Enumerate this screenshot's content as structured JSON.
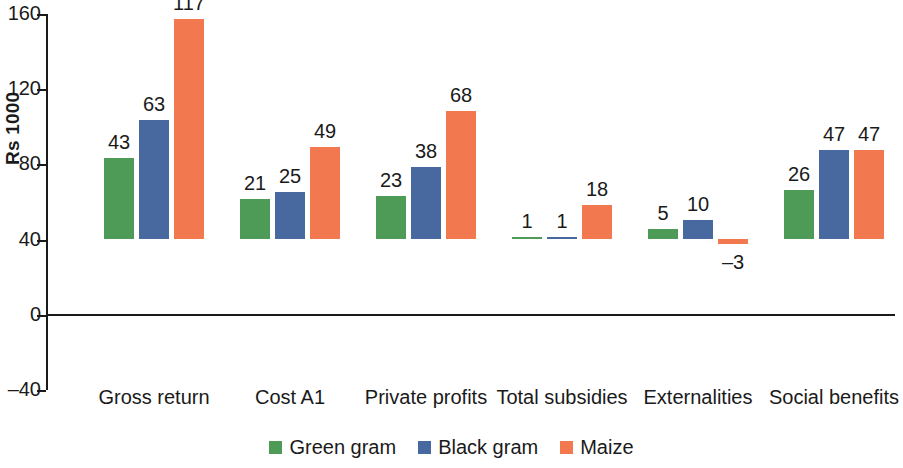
{
  "chart_data": {
    "type": "bar",
    "title": "",
    "subtitle": "",
    "xlabel": "",
    "ylabel": "Rs 1000",
    "ylim": [
      -40,
      160
    ],
    "yticks": [
      -40,
      0,
      40,
      80,
      120,
      160
    ],
    "ytick_labels": [
      "–40",
      "0",
      "40",
      "80",
      "120",
      "160"
    ],
    "grid": false,
    "legend_position": "bottom",
    "categories": [
      "Gross return",
      "Cost A1",
      "Private profits",
      "Total subsidies",
      "Externalities",
      "Social benefits"
    ],
    "series": [
      {
        "name": "Green gram",
        "color": "#4E9B58",
        "values": [
          43,
          21,
          23,
          1,
          5,
          26
        ],
        "labels": [
          "43",
          "21",
          "23",
          "1",
          "5",
          "26"
        ]
      },
      {
        "name": "Black gram",
        "color": "#48699F",
        "values": [
          63,
          25,
          38,
          1,
          10,
          47
        ],
        "labels": [
          "63",
          "25",
          "38",
          "1",
          "10",
          "47"
        ]
      },
      {
        "name": "Maize",
        "color": "#F2784F",
        "values": [
          117,
          49,
          68,
          18,
          -3,
          47
        ],
        "labels": [
          "117",
          "49",
          "68",
          "18",
          "–3",
          "47"
        ]
      }
    ]
  },
  "axis": {
    "y_title": "Rs 1000"
  }
}
